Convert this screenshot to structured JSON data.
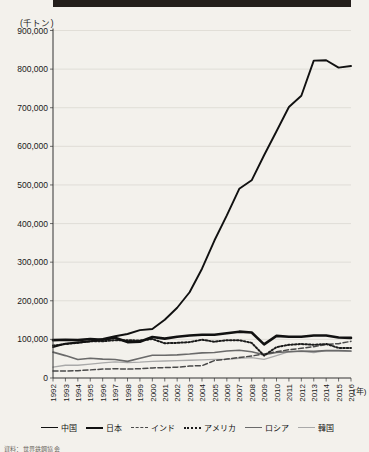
{
  "figure": {
    "unit_label": "(千トン)",
    "x_axis_label": "(年)",
    "caption": "資料：世界鉄鋼協会"
  },
  "legend": {
    "position": "bottom",
    "items": [
      {
        "label": "中国",
        "style": "solid-bold",
        "color": "#111111",
        "width": 1.9,
        "dash": ""
      },
      {
        "label": "日本",
        "style": "solid-extra",
        "color": "#111111",
        "width": 2.6,
        "dash": ""
      },
      {
        "label": "インド",
        "style": "dashed",
        "color": "#4a4a4a",
        "width": 1.5,
        "dash": "5,2.5"
      },
      {
        "label": "アメリカ",
        "style": "dotted",
        "color": "#1b1b1b",
        "width": 2.0,
        "dash": "1.6,1.9"
      },
      {
        "label": "ロシア",
        "style": "solid-mid",
        "color": "#6a6a6a",
        "width": 1.6,
        "dash": ""
      },
      {
        "label": "韓国",
        "style": "solid-light",
        "color": "#a9a9a9",
        "width": 1.3,
        "dash": ""
      }
    ]
  },
  "chart_data": {
    "type": "line",
    "title": "",
    "xlabel": "(年)",
    "ylabel": "(千トン)",
    "xlim": [
      1992,
      2016
    ],
    "ylim": [
      0,
      900000
    ],
    "ytick_step": 100000,
    "grid": true,
    "legend_position": "bottom",
    "x": [
      1992,
      1993,
      1994,
      1995,
      1996,
      1997,
      1998,
      1999,
      2000,
      2001,
      2002,
      2003,
      2004,
      2005,
      2006,
      2007,
      2008,
      2009,
      2010,
      2011,
      2012,
      2013,
      2014,
      2015,
      2016
    ],
    "ytick_labels": [
      "0",
      "100,000",
      "200,000",
      "300,000",
      "400,000",
      "500,000",
      "600,000",
      "700,000",
      "800,000",
      "900,000"
    ],
    "xtick_labels": [
      "1992",
      "1993",
      "1994",
      "1995",
      "1996",
      "1997",
      "1998",
      "1999",
      "2000",
      "2001",
      "2002",
      "2003",
      "2004",
      "2005",
      "2006",
      "2007",
      "2008",
      "2009",
      "2010",
      "2011",
      "2012",
      "2013",
      "2014",
      "2015",
      "2016"
    ],
    "series": [
      {
        "name": "中国",
        "values": [
          80000,
          89000,
          92000,
          95000,
          101000,
          108000,
          114000,
          124000,
          127000,
          151000,
          182000,
          222000,
          283000,
          356000,
          421000,
          490000,
          512000,
          577000,
          639000,
          702000,
          731000,
          822000,
          823000,
          804000,
          808000
        ]
      },
      {
        "name": "日本",
        "values": [
          98000,
          99000,
          98000,
          101000,
          99000,
          104000,
          93000,
          94000,
          106000,
          102000,
          107000,
          110000,
          112000,
          112000,
          116000,
          120000,
          118000,
          87000,
          109000,
          107000,
          107000,
          110000,
          110000,
          105000,
          104000
        ]
      },
      {
        "name": "インド",
        "values": [
          18000,
          18000,
          19000,
          21000,
          23000,
          24000,
          23000,
          24000,
          26000,
          27000,
          28000,
          31000,
          32000,
          45000,
          49000,
          53000,
          57000,
          62000,
          68000,
          73000,
          77000,
          81000,
          87000,
          89000,
          95000
        ]
      },
      {
        "name": "アメリカ",
        "values": [
          84000,
          88000,
          91000,
          95000,
          95000,
          98000,
          98000,
          97000,
          101000,
          90000,
          91000,
          93000,
          99000,
          94000,
          98000,
          98000,
          91000,
          58000,
          80000,
          86000,
          88000,
          86000,
          88000,
          78000,
          78000
        ]
      },
      {
        "name": "ロシア",
        "values": [
          67000,
          58000,
          48000,
          51000,
          49000,
          48000,
          43000,
          51000,
          59000,
          59000,
          60000,
          62000,
          65000,
          66000,
          70000,
          72000,
          68000,
          60000,
          66000,
          68000,
          70000,
          69000,
          71000,
          71000,
          70000
        ]
      },
      {
        "name": "韓国",
        "values": [
          28000,
          33000,
          33000,
          36000,
          39000,
          42000,
          40000,
          41000,
          43000,
          44000,
          45000,
          46000,
          47000,
          48000,
          48000,
          51000,
          53000,
          48000,
          58000,
          68000,
          69000,
          66000,
          71000,
          70000,
          69000
        ]
      }
    ]
  }
}
